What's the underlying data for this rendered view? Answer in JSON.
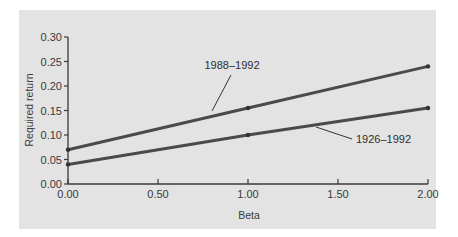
{
  "chart_data": {
    "type": "line",
    "title": "",
    "xlabel": "Beta",
    "ylabel": "Required return",
    "xlim": [
      0,
      2
    ],
    "ylim": [
      0,
      0.3
    ],
    "x_ticks": [
      "0.00",
      "0.50",
      "1.00",
      "1.50",
      "2.00"
    ],
    "y_ticks": [
      "0.00",
      "0.05",
      "0.10",
      "0.15",
      "0.20",
      "0.25",
      "0.30"
    ],
    "grid": false,
    "legend": "inline labels with leader lines",
    "x": [
      0.0,
      1.0,
      2.0
    ],
    "series": [
      {
        "name": "1988–1992",
        "values": [
          0.07,
          0.155,
          0.24
        ]
      },
      {
        "name": "1926–1992",
        "values": [
          0.04,
          0.1,
          0.155
        ]
      }
    ]
  },
  "colors": {
    "panel_bg": "#e3e3e3",
    "line": "#4a4a4a",
    "axis": "#3a3a3a"
  }
}
